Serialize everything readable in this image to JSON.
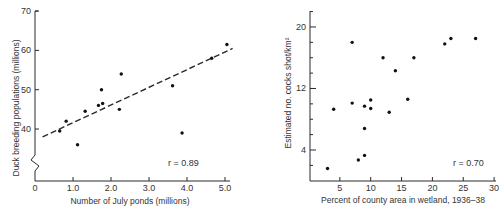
{
  "chart_data": [
    {
      "type": "scatter",
      "xlabel": "Number of July ponds (millions)",
      "ylabel": "Duck breeding populations (millions)",
      "x_ticks": [
        "0",
        "1.0",
        "2.0",
        "3.0",
        "4.0",
        "5.0"
      ],
      "y_ticks": [
        "40",
        "50",
        "60",
        "70"
      ],
      "xlim": [
        0,
        5.3
      ],
      "ylim": [
        30,
        70
      ],
      "y_axis_break": true,
      "grid": false,
      "annotation": "r = 0.89",
      "points": [
        {
          "x": 0.65,
          "y": 39.5
        },
        {
          "x": 0.82,
          "y": 42.0
        },
        {
          "x": 1.12,
          "y": 36.0
        },
        {
          "x": 1.32,
          "y": 44.5
        },
        {
          "x": 1.67,
          "y": 46.0
        },
        {
          "x": 1.75,
          "y": 50.0
        },
        {
          "x": 1.78,
          "y": 46.5
        },
        {
          "x": 2.22,
          "y": 45.0
        },
        {
          "x": 2.27,
          "y": 54.0
        },
        {
          "x": 3.62,
          "y": 51.0
        },
        {
          "x": 3.87,
          "y": 39.0
        },
        {
          "x": 4.65,
          "y": 58.0
        },
        {
          "x": 5.05,
          "y": 61.5
        }
      ],
      "trendline": {
        "style": "dashed",
        "x": [
          0.2,
          5.2
        ],
        "y": [
          38.0,
          60.5
        ]
      }
    },
    {
      "type": "scatter",
      "xlabel": "Percent of county area in wetland, 1936–38",
      "ylabel": "Estimated no. cocks shot/km²",
      "x_ticks": [
        "5",
        "10",
        "15",
        "20",
        "25",
        "30"
      ],
      "y_ticks": [
        "4",
        "12",
        "20"
      ],
      "xlim": [
        0,
        30
      ],
      "ylim": [
        0,
        22
      ],
      "grid": false,
      "annotation": "r = 0.70",
      "points": [
        {
          "x": 3,
          "y": 1.6
        },
        {
          "x": 4,
          "y": 9.3
        },
        {
          "x": 7,
          "y": 10.1
        },
        {
          "x": 7,
          "y": 18.0
        },
        {
          "x": 8,
          "y": 2.7
        },
        {
          "x": 9,
          "y": 3.3
        },
        {
          "x": 9,
          "y": 6.8
        },
        {
          "x": 9,
          "y": 9.7
        },
        {
          "x": 10,
          "y": 10.5
        },
        {
          "x": 10,
          "y": 9.4
        },
        {
          "x": 12,
          "y": 16.0
        },
        {
          "x": 13,
          "y": 8.9
        },
        {
          "x": 14,
          "y": 14.3
        },
        {
          "x": 16,
          "y": 10.6
        },
        {
          "x": 17,
          "y": 16.0
        },
        {
          "x": 22,
          "y": 17.8
        },
        {
          "x": 23,
          "y": 18.5
        },
        {
          "x": 27,
          "y": 18.5
        }
      ]
    }
  ]
}
